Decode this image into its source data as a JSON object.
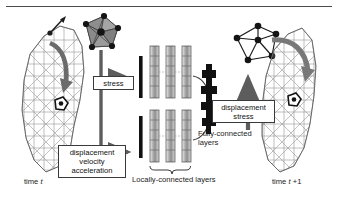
{
  "figure": {
    "type": "diagram",
    "caption_rule": true,
    "background": "#ffffff",
    "ink": "#1a1a1a",
    "accent_gray": "#6e6e6e",
    "mesh_stroke": "#8d8d8d",
    "polyhedron_fill": "#9a9a9a",
    "block_dark": "#111111"
  },
  "labels": {
    "time_t": "time t",
    "time_t_plus_1": "time t +1",
    "locally_connected": "Locally-connected layers",
    "fully_connected_line1": "Fully-connected",
    "fully_connected_line2": "layers"
  },
  "boxes": {
    "stress": {
      "lines": [
        "stress"
      ]
    },
    "input_features": {
      "lines": [
        "displacement",
        "velocity",
        "acceleration"
      ]
    },
    "output_features": {
      "lines": [
        "displacement",
        "stress"
      ]
    }
  },
  "nodes": {
    "left_graph_name": "shaded-polyhedron-graph",
    "right_graph_name": "outline-node-graph",
    "left_mesh_name": "triangulated-organ-mesh-time-t",
    "right_mesh_name": "triangulated-organ-mesh-time-t-plus-1"
  },
  "columns": {
    "upper_layer_count": 3,
    "lower_layer_count": 3,
    "input_bar_count": 2
  }
}
